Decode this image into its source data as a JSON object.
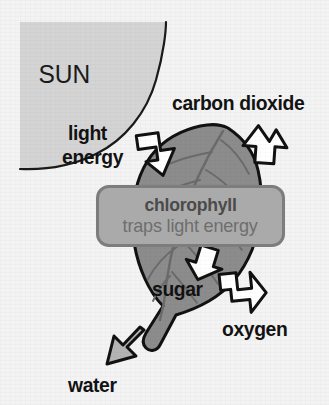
{
  "diagram": {
    "background_color": "#f3f3f3"
  },
  "sun": {
    "label": "SUN",
    "fill_color": "#d4d4d4",
    "outline_color": "#1a1a1a"
  },
  "leaf": {
    "fill_color": "#8c8c8c",
    "outline_color": "#111111",
    "vein_color": "#6b6b6b"
  },
  "callout": {
    "title": "chlorophyll",
    "subtitle": "traps light energy",
    "fill_color": "#aaaaaa",
    "border_color": "#7d7d7d",
    "title_color": "#4b4b4b",
    "subtitle_color": "#6e6e6e"
  },
  "labels": {
    "light": "light",
    "energy": "energy",
    "carbon_dioxide": "carbon dioxide",
    "sugar": "sugar",
    "oxygen": "oxygen",
    "water": "water"
  },
  "arrows": [
    {
      "name": "light-energy-arrow",
      "direction": "down-right",
      "fill": "#ffffff",
      "stroke": "#111111",
      "points_to": "leaf"
    },
    {
      "name": "carbon-dioxide-arrow",
      "direction": "down-left",
      "fill": "#ffffff",
      "stroke": "#111111",
      "points_to": "leaf"
    },
    {
      "name": "sugar-arrow",
      "direction": "down-left",
      "fill": "#ffffff",
      "stroke": "#111111",
      "points_to": "out"
    },
    {
      "name": "oxygen-arrow",
      "direction": "down-right",
      "fill": "#ffffff",
      "stroke": "#111111",
      "points_to": "out"
    },
    {
      "name": "water-arrow",
      "direction": "up-right",
      "fill": "#b4b4b4",
      "stroke": "#111111",
      "points_to": "leaf"
    }
  ]
}
